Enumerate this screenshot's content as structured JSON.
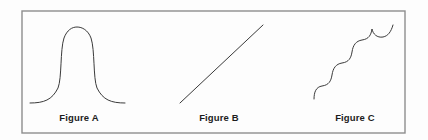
{
  "panel": {
    "width": 428,
    "height": 140,
    "background_color": "#fdfdfd",
    "border_color": "#8d8d8d",
    "curve_color": "#3a3a3a",
    "border_rect": {
      "x": 22,
      "y": 11,
      "width": 383,
      "height": 122
    }
  },
  "figures": [
    {
      "id": "figure-a",
      "caption": "Figure A",
      "shape_name": "plateau-curve",
      "description": "flat-topped bell curve with long flat tails",
      "path": "M 30 103 C 44 103 52 100 58 88 C 62 78 60 50 64 38 C 67 30 72 27 77 27 C 82 27 88 30 91 38 C 95 50 93 78 97 88 C 103 100 111 103 125 103",
      "bbox": {
        "x": 30,
        "y": 27,
        "width": 95,
        "height": 76
      }
    },
    {
      "id": "figure-b",
      "caption": "Figure B",
      "shape_name": "straight-diagonal-line",
      "description": "straight line rising to the right",
      "path": "M 180 103 L 263 25",
      "bbox": {
        "x": 180,
        "y": 25,
        "width": 83,
        "height": 78
      }
    },
    {
      "id": "figure-c",
      "caption": "Figure C",
      "shape_name": "scalloped-staircase-curve",
      "description": "ascending staircase of five scalloped arcs",
      "scallop_count": 5,
      "path": "M 314 99 C 314 92 316 87 322 86 C 329 85 331 81 332 75 C 333 68 336 64 342 63 C 349 62 351 58 352 52 C 353 45 356 41 362 40 C 369 39 371 35 372 29 C 373 34 377 38 383 37 C 388 36 391 32 393 25",
      "bbox": {
        "x": 314,
        "y": 25,
        "width": 79,
        "height": 74
      }
    }
  ],
  "captions": {
    "a": "Figure A",
    "b": "Figure B",
    "c": "Figure C"
  }
}
